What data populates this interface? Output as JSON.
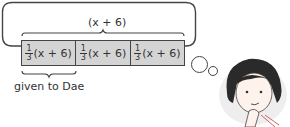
{
  "diagram": {
    "top_label": "(x + 6)",
    "segments": [
      {
        "coef_num": "1",
        "coef_den": "3",
        "expr": "(x + 6)"
      },
      {
        "coef_num": "1",
        "coef_den": "3",
        "expr": "(x + 6)"
      },
      {
        "coef_num": "1",
        "coef_den": "3",
        "expr": "(x + 6)"
      }
    ],
    "bottom_label": "given to Dae",
    "bar_fill": "#d4d4d4",
    "character": "thinking-girl"
  }
}
